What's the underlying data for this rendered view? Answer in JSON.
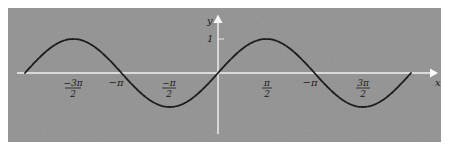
{
  "chart_data": {
    "type": "line",
    "title": "",
    "xlabel": "x",
    "ylabel": "y",
    "function": "y = sin x",
    "xlim": [
      -6.2832,
      6.2832
    ],
    "ylim": [
      -1,
      1
    ],
    "grid": false,
    "legend": null,
    "line_style": "dashed",
    "x_tick_labels": [
      {
        "label": "−3π/2",
        "num": "−3π",
        "den": "2",
        "value": -4.7124
      },
      {
        "label": "−π",
        "value": -3.1416
      },
      {
        "label": "−π/2",
        "num": "−π",
        "den": "2",
        "value": -1.5708
      },
      {
        "label": "π/2",
        "num": "π",
        "den": "2",
        "value": 1.5708
      },
      {
        "label": "−π",
        "value": 3.1416
      },
      {
        "label": "3π/2",
        "num": "3π",
        "den": "2",
        "value": 4.7124
      }
    ],
    "y_tick_labels": [
      {
        "label": "1",
        "value": 1
      }
    ],
    "series": [
      {
        "name": "sin x",
        "x": [
          -6.2832,
          -4.7124,
          -3.1416,
          -1.5708,
          0,
          1.5708,
          3.1416,
          4.7124,
          6.2832
        ],
        "y": [
          0,
          1,
          0,
          -1,
          0,
          1,
          0,
          -1,
          0
        ]
      }
    ]
  },
  "labels": {
    "y_axis": "y",
    "x_axis": "x",
    "y_tick_1": "1",
    "t_m3pi2_num": "−3π",
    "t_m3pi2_den": "2",
    "t_mpi": "−π",
    "t_mpi2_num": "−π",
    "t_mpi2_den": "2",
    "t_pi2_num": "π",
    "t_pi2_den": "2",
    "t_pi": "−π",
    "t_3pi2_num": "3π",
    "t_3pi2_den": "2"
  },
  "colors": {
    "panel": "#9a9a9a",
    "axes": "#f2f2f2",
    "curve": "#1c1c1c"
  }
}
